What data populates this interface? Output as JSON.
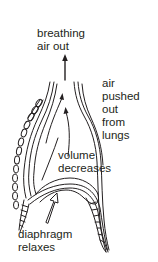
{
  "diagram": {
    "labels": {
      "breathing_out_line1": "breathing",
      "breathing_out_line2": "air out",
      "air_pushed_line1": "air",
      "air_pushed_line2": "pushed",
      "air_pushed_line3": "out",
      "air_pushed_line4": "from",
      "air_pushed_line5": "lungs",
      "volume_line1": "volume",
      "volume_line2": "decreases",
      "diaphragm_line1": "diaphragm",
      "diaphragm_line2": "relaxes"
    },
    "colors": {
      "ink": "#231f20",
      "background": "#ffffff"
    }
  }
}
